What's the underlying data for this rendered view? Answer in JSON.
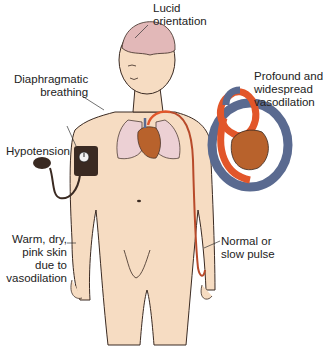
{
  "figure": {
    "labels": {
      "lucid": [
        "Lucid",
        "orientation"
      ],
      "diaphragm": [
        "Diaphragmatic",
        "breathing"
      ],
      "vasodilation": [
        "Profound and",
        "widespread",
        "vasodilation"
      ],
      "hypotension": [
        "Hypotension"
      ],
      "skin": [
        "Warm, dry,",
        "pink skin",
        "due to",
        "vasodilation"
      ],
      "pulse": [
        "Normal or",
        "slow pulse"
      ]
    },
    "colors": {
      "skin": "#f6dcc2",
      "brain": "#e2b8b8",
      "lungs": "#ecd0d4",
      "heart": "#b8622c",
      "artery": "#e2562a",
      "vein": "#5a6a90",
      "cuff": "#3a2a22",
      "outline": "#3a2a22"
    }
  }
}
